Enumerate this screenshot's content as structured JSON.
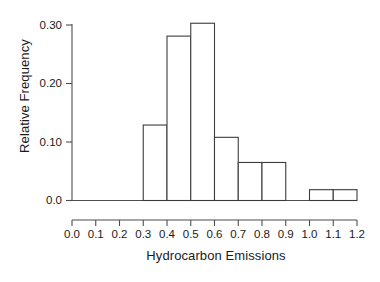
{
  "chart_data": {
    "type": "bar",
    "title": "",
    "subtitle": "",
    "xlabel": "Hydrocarbon Emissions",
    "ylabel": "Relative Frequency",
    "grid": false,
    "legend": null,
    "bin_width": 0.1,
    "xlim": [
      0.0,
      1.2
    ],
    "ylim": [
      0.0,
      0.32
    ],
    "x_ticks": [
      0.0,
      0.1,
      0.2,
      0.3,
      0.4,
      0.5,
      0.6,
      0.7,
      0.8,
      0.9,
      1.0,
      1.1,
      1.2
    ],
    "x_tick_labels": [
      "0.0",
      "0.1",
      "0.2",
      "0.3",
      "0.4",
      "0.5",
      "0.6",
      "0.7",
      "0.8",
      "0.9",
      "1.0",
      "1.1",
      "1.2"
    ],
    "y_ticks": [
      0.0,
      0.1,
      0.2,
      0.3
    ],
    "y_tick_labels": [
      "0.0",
      "0.10",
      "0.20",
      "0.30"
    ],
    "bins": [
      {
        "lo": 0.0,
        "hi": 0.1,
        "value": 0.0
      },
      {
        "lo": 0.1,
        "hi": 0.2,
        "value": 0.0
      },
      {
        "lo": 0.2,
        "hi": 0.3,
        "value": 0.0
      },
      {
        "lo": 0.3,
        "hi": 0.4,
        "value": 0.129
      },
      {
        "lo": 0.4,
        "hi": 0.5,
        "value": 0.281
      },
      {
        "lo": 0.5,
        "hi": 0.6,
        "value": 0.303
      },
      {
        "lo": 0.6,
        "hi": 0.7,
        "value": 0.108
      },
      {
        "lo": 0.7,
        "hi": 0.8,
        "value": 0.065
      },
      {
        "lo": 0.8,
        "hi": 0.9,
        "value": 0.065
      },
      {
        "lo": 0.9,
        "hi": 1.0,
        "value": 0.0
      },
      {
        "lo": 1.0,
        "hi": 1.1,
        "value": 0.0185
      },
      {
        "lo": 1.1,
        "hi": 1.2,
        "value": 0.0185
      }
    ],
    "categories": [
      "0.0-0.1",
      "0.1-0.2",
      "0.2-0.3",
      "0.3-0.4",
      "0.4-0.5",
      "0.5-0.6",
      "0.6-0.7",
      "0.7-0.8",
      "0.8-0.9",
      "0.9-1.0",
      "1.0-1.1",
      "1.1-1.2"
    ],
    "values": [
      0.0,
      0.0,
      0.0,
      0.129,
      0.281,
      0.303,
      0.108,
      0.065,
      0.065,
      0.0,
      0.0185,
      0.0185
    ],
    "colors": {
      "bar_fill": "#ffffff",
      "bar_stroke": "#3c3c3c",
      "axis": "#4d4d4d",
      "text": "#1a1a1a",
      "background": "#ffffff"
    }
  }
}
